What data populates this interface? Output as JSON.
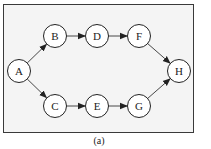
{
  "figure": {
    "caption": "(a)",
    "background": "#f4f4f4",
    "border_color": "#3a3a3a",
    "node_fill": "#ffffff",
    "node_stroke": "#222222",
    "edge_color": "#333333"
  },
  "nodes": [
    {
      "id": "A",
      "label": "A",
      "x": 19,
      "y": 71
    },
    {
      "id": "B",
      "label": "B",
      "x": 55,
      "y": 36
    },
    {
      "id": "D",
      "label": "D",
      "x": 97,
      "y": 36
    },
    {
      "id": "F",
      "label": "F",
      "x": 139,
      "y": 36
    },
    {
      "id": "H",
      "label": "H",
      "x": 179,
      "y": 71
    },
    {
      "id": "C",
      "label": "C",
      "x": 55,
      "y": 106
    },
    {
      "id": "E",
      "label": "E",
      "x": 97,
      "y": 106
    },
    {
      "id": "G",
      "label": "G",
      "x": 139,
      "y": 106
    }
  ],
  "edges": [
    {
      "from": "A",
      "to": "B"
    },
    {
      "from": "B",
      "to": "D"
    },
    {
      "from": "D",
      "to": "F"
    },
    {
      "from": "F",
      "to": "H"
    },
    {
      "from": "A",
      "to": "C"
    },
    {
      "from": "C",
      "to": "E"
    },
    {
      "from": "E",
      "to": "G"
    },
    {
      "from": "G",
      "to": "H"
    }
  ]
}
